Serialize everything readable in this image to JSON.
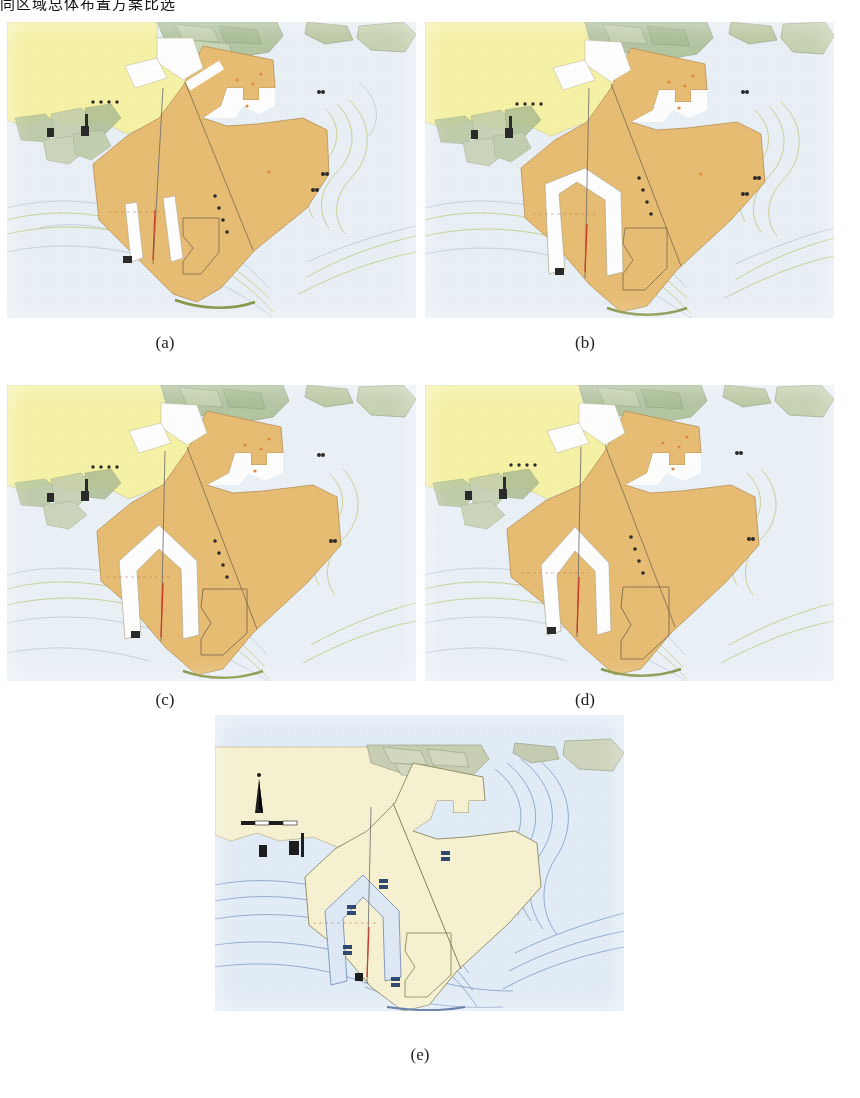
{
  "document": {
    "top_caption": "同区域总体布置方案比选",
    "figure_kind": "port-layout-plan-variants",
    "panel_count": 5
  },
  "labels": {
    "a": "(a)",
    "b": "(b)",
    "c": "(c)",
    "d": "(d)",
    "e": "(e)"
  },
  "palette": {
    "sea": "#e6eef4",
    "sea_deep": "#dbe6ef",
    "land_yellow": "#f6f2a6",
    "reclamation_orange": "#e8bd74",
    "reclamation_orange_dark": "#dcae63",
    "channel_white": "#ffffff",
    "vegetation_green": "#b9c9a0",
    "contour_olive": "#b9bd52",
    "contour_blue": "#8fa6c4",
    "outline_brown": "#8a7352",
    "mark_red": "#cc3a2a",
    "mark_black": "#2a2a2a",
    "panel_e_land": "#f7f2d2",
    "panel_e_sea": "#dce8f4",
    "panel_e_line": "#4a6ea8"
  },
  "panels": [
    {
      "id": "a",
      "label": "(a)",
      "scheme": "方案一",
      "style": "color",
      "description": "Port master layout with reclaimed terminal area in orange; two narrow straight slip basins cut into the southwest reclamation; single straight breakwater alignment line crossing the basin.",
      "channel_type": "two-narrow-parallel-slips",
      "reclamation_fill": "#e8bd74",
      "land_fill": "#f6f2a6",
      "sea_fill": "#e6eef4",
      "features": [
        {
          "name": "existing-port-area",
          "kind": "land",
          "color": "#f6f2a6"
        },
        {
          "name": "reclamation-polygon",
          "kind": "fill",
          "color": "#e8bd74"
        },
        {
          "name": "comb-berth-pier",
          "kind": "notch",
          "color": "#ffffff"
        },
        {
          "name": "slip-basin-west",
          "kind": "channel",
          "color": "#ffffff"
        },
        {
          "name": "slip-basin-east",
          "kind": "channel",
          "color": "#ffffff"
        },
        {
          "name": "alignment-axis",
          "kind": "line",
          "color": "#555555"
        },
        {
          "name": "red-centerline",
          "kind": "line",
          "color": "#cc3a2a"
        },
        {
          "name": "depth-contours",
          "kind": "contour",
          "color": "#b9bd52"
        },
        {
          "name": "dotted-boundary",
          "kind": "dotted",
          "color": "#2a2a2a"
        }
      ]
    },
    {
      "id": "b",
      "label": "(b)",
      "scheme": "方案二",
      "style": "color",
      "description": "Variant with a single wide tapered navigation channel opening to the south, reclamation extended further east; comb-type finger piers retained on the north edge.",
      "channel_type": "single-wide-tapered-channel",
      "reclamation_fill": "#e8bd74",
      "land_fill": "#f6f2a6",
      "sea_fill": "#e6eef4",
      "features": [
        {
          "name": "existing-port-area",
          "kind": "land",
          "color": "#f6f2a6"
        },
        {
          "name": "reclamation-polygon",
          "kind": "fill",
          "color": "#e8bd74"
        },
        {
          "name": "comb-berth-pier",
          "kind": "notch",
          "color": "#ffffff"
        },
        {
          "name": "wide-navigation-channel",
          "kind": "channel",
          "color": "#ffffff"
        },
        {
          "name": "alignment-axis",
          "kind": "line",
          "color": "#555555"
        },
        {
          "name": "red-centerline",
          "kind": "line",
          "color": "#cc3a2a"
        },
        {
          "name": "depth-contours",
          "kind": "contour",
          "color": "#b9bd52"
        },
        {
          "name": "dotted-boundary",
          "kind": "dotted",
          "color": "#2a2a2a"
        }
      ]
    },
    {
      "id": "c",
      "label": "(c)",
      "scheme": "方案三",
      "style": "color",
      "description": "Variant with a pointed-head U-shaped harbour basin; an additional inner quay polygon outlined to the east of the basin.",
      "channel_type": "pointed-head-u-basin",
      "reclamation_fill": "#e8bd74",
      "land_fill": "#f6f2a6",
      "sea_fill": "#e6eef4",
      "features": [
        {
          "name": "existing-port-area",
          "kind": "land",
          "color": "#f6f2a6"
        },
        {
          "name": "reclamation-polygon",
          "kind": "fill",
          "color": "#e8bd74"
        },
        {
          "name": "comb-berth-pier",
          "kind": "notch",
          "color": "#ffffff"
        },
        {
          "name": "u-shaped-basin",
          "kind": "channel",
          "color": "#ffffff"
        },
        {
          "name": "inner-quay-outline",
          "kind": "outline",
          "color": "#8a7352"
        },
        {
          "name": "alignment-axis",
          "kind": "line",
          "color": "#555555"
        },
        {
          "name": "red-centerline",
          "kind": "line",
          "color": "#cc3a2a"
        },
        {
          "name": "depth-contours",
          "kind": "contour",
          "color": "#b9bd52"
        },
        {
          "name": "dotted-boundary",
          "kind": "dotted",
          "color": "#2a2a2a"
        }
      ]
    },
    {
      "id": "d",
      "label": "(d)",
      "scheme": "方案四",
      "style": "color",
      "description": "Variant with a narrower pointed U-shaped basin shifted west; reclamation covers a larger continuous block to the east.",
      "channel_type": "narrow-pointed-u-basin",
      "reclamation_fill": "#e8bd74",
      "land_fill": "#f6f2a6",
      "sea_fill": "#e6eef4",
      "features": [
        {
          "name": "existing-port-area",
          "kind": "land",
          "color": "#f6f2a6"
        },
        {
          "name": "reclamation-polygon",
          "kind": "fill",
          "color": "#e8bd74"
        },
        {
          "name": "comb-berth-pier",
          "kind": "notch",
          "color": "#ffffff"
        },
        {
          "name": "u-shaped-basin",
          "kind": "channel",
          "color": "#ffffff"
        },
        {
          "name": "inner-quay-outline",
          "kind": "outline",
          "color": "#8a7352"
        },
        {
          "name": "alignment-axis",
          "kind": "line",
          "color": "#555555"
        },
        {
          "name": "red-centerline",
          "kind": "line",
          "color": "#cc3a2a"
        },
        {
          "name": "depth-contours",
          "kind": "contour",
          "color": "#b9bd52"
        },
        {
          "name": "dotted-boundary",
          "kind": "dotted",
          "color": "#2a2a2a"
        }
      ]
    },
    {
      "id": "e",
      "label": "(e)",
      "scheme": "现状",
      "style": "monochrome-blue",
      "description": "Existing-condition chart rendered in blue line work on cream land; bathymetric streamlines shown in blue, with a north arrow and scale bar at the upper left.",
      "channel_type": "existing-condition",
      "reclamation_fill": "#f7f2d2",
      "land_fill": "#f7f2d2",
      "sea_fill": "#dce8f4",
      "features": [
        {
          "name": "north-arrow",
          "kind": "symbol",
          "color": "#1d1d1d"
        },
        {
          "name": "scale-bar",
          "kind": "symbol",
          "color": "#1d1d1d"
        },
        {
          "name": "existing-land",
          "kind": "fill",
          "color": "#f7f2d2"
        },
        {
          "name": "bathymetric-streamlines",
          "kind": "contour",
          "color": "#4a6ea8"
        },
        {
          "name": "u-shaped-basin",
          "kind": "channel",
          "color": "#dce8f4"
        },
        {
          "name": "alignment-axis",
          "kind": "line",
          "color": "#555555"
        },
        {
          "name": "red-centerline",
          "kind": "line",
          "color": "#cc3a2a"
        }
      ]
    }
  ]
}
